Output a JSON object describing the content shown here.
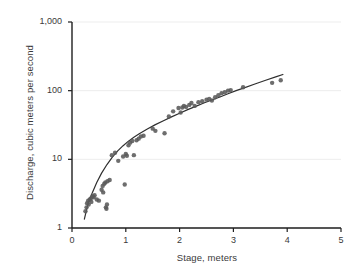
{
  "chart_data": {
    "type": "scatter",
    "title": "",
    "subtitle": "",
    "xlabel": "Stage, meters",
    "ylabel": "Discharge, cubic meters per second",
    "xscale": "linear",
    "yscale": "log",
    "xlim": [
      0,
      5
    ],
    "ylim": [
      1,
      1000
    ],
    "xticks": [
      0,
      1,
      2,
      3,
      4,
      5
    ],
    "xtick_labels": [
      "0",
      "1",
      "2",
      "3",
      "4",
      "5"
    ],
    "yticks": [
      1,
      10,
      100,
      1000
    ],
    "ytick_labels": [
      "1",
      "10",
      "100",
      "1,000"
    ],
    "grid": "horizontal-faint",
    "legend": "none",
    "marker_color": "#5a5a5a",
    "curve_color": "#2f2f2f",
    "axis_color": "#1f1f1f",
    "grid_color": "#ededed",
    "series": [
      {
        "name": "Stage-discharge measurements",
        "type": "scatter",
        "points": [
          [
            0.25,
            1.75
          ],
          [
            0.27,
            2.0
          ],
          [
            0.28,
            2.3
          ],
          [
            0.3,
            2.5
          ],
          [
            0.31,
            2.2
          ],
          [
            0.33,
            2.6
          ],
          [
            0.35,
            2.7
          ],
          [
            0.36,
            2.4
          ],
          [
            0.38,
            2.9
          ],
          [
            0.4,
            2.8
          ],
          [
            0.42,
            3.0
          ],
          [
            0.46,
            2.6
          ],
          [
            0.5,
            2.5
          ],
          [
            0.55,
            3.6
          ],
          [
            0.57,
            4.1
          ],
          [
            0.58,
            3.3
          ],
          [
            0.6,
            4.4
          ],
          [
            0.62,
            4.6
          ],
          [
            0.63,
            2.0
          ],
          [
            0.64,
            1.9
          ],
          [
            0.65,
            2.2
          ],
          [
            0.66,
            4.8
          ],
          [
            0.7,
            5.0
          ],
          [
            0.74,
            11.5
          ],
          [
            0.8,
            12.5
          ],
          [
            0.86,
            9.5
          ],
          [
            0.95,
            11.0
          ],
          [
            0.98,
            4.3
          ],
          [
            1.0,
            12.0
          ],
          [
            1.02,
            11.3
          ],
          [
            1.05,
            16.0
          ],
          [
            1.08,
            17.5
          ],
          [
            1.12,
            18.5
          ],
          [
            1.15,
            11.5
          ],
          [
            1.2,
            19.0
          ],
          [
            1.24,
            20.0
          ],
          [
            1.28,
            21.5
          ],
          [
            1.33,
            22.0
          ],
          [
            1.5,
            28.0
          ],
          [
            1.55,
            26.0
          ],
          [
            1.72,
            24.0
          ],
          [
            1.8,
            42.0
          ],
          [
            1.88,
            50.0
          ],
          [
            1.98,
            56.0
          ],
          [
            2.02,
            48.0
          ],
          [
            2.05,
            57.0
          ],
          [
            2.08,
            60.0
          ],
          [
            2.12,
            58.0
          ],
          [
            2.18,
            62.0
          ],
          [
            2.22,
            66.0
          ],
          [
            2.28,
            60.0
          ],
          [
            2.35,
            68.0
          ],
          [
            2.42,
            70.0
          ],
          [
            2.5,
            74.0
          ],
          [
            2.55,
            76.0
          ],
          [
            2.6,
            72.0
          ],
          [
            2.66,
            80.0
          ],
          [
            2.72,
            86.0
          ],
          [
            2.78,
            92.0
          ],
          [
            2.84,
            95.0
          ],
          [
            2.9,
            100.0
          ],
          [
            2.95,
            102.0
          ],
          [
            3.18,
            112.0
          ],
          [
            3.72,
            130.0
          ],
          [
            3.88,
            142.0
          ]
        ]
      },
      {
        "name": "Fitted rating curve",
        "type": "line",
        "points": [
          [
            0.23,
            1.35
          ],
          [
            0.3,
            2.3
          ],
          [
            0.38,
            3.3
          ],
          [
            0.46,
            4.6
          ],
          [
            0.55,
            6.3
          ],
          [
            0.65,
            8.4
          ],
          [
            0.75,
            10.8
          ],
          [
            0.85,
            13.3
          ],
          [
            0.95,
            15.8
          ],
          [
            1.05,
            18.4
          ],
          [
            1.15,
            21.0
          ],
          [
            1.25,
            23.6
          ],
          [
            1.4,
            27.6
          ],
          [
            1.55,
            32.0
          ],
          [
            1.7,
            36.5
          ],
          [
            1.85,
            41.5
          ],
          [
            2.0,
            47.0
          ],
          [
            2.15,
            53.0
          ],
          [
            2.3,
            59.0
          ],
          [
            2.45,
            66.0
          ],
          [
            2.6,
            73.0
          ],
          [
            2.75,
            81.0
          ],
          [
            2.9,
            90.0
          ],
          [
            3.05,
            100.0
          ],
          [
            3.2,
            110.0
          ],
          [
            3.4,
            125.0
          ],
          [
            3.6,
            142.0
          ],
          [
            3.8,
            160.0
          ],
          [
            3.92,
            172.0
          ]
        ]
      }
    ]
  },
  "figure": {
    "background_color": "#ffffff"
  }
}
